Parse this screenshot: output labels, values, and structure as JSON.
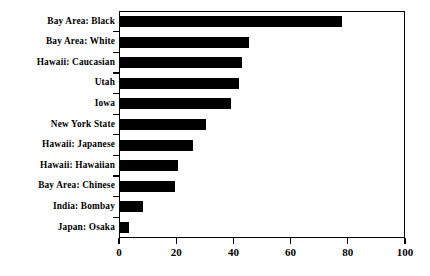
{
  "chart_data": {
    "type": "bar",
    "orientation": "horizontal",
    "title": "",
    "subtitle": "",
    "xlabel": "",
    "ylabel": "",
    "xlim": [
      0,
      100
    ],
    "xticks": [
      0,
      20,
      40,
      60,
      80,
      100
    ],
    "xtick_labels": [
      "0",
      "20",
      "40",
      "60",
      "80",
      "100"
    ],
    "grid": false,
    "legend": null,
    "bar_color": "#000000",
    "frame_color": "#000000",
    "background": "#ffffff",
    "categories": [
      "Bay Area: Black",
      "Bay Area: White",
      "Hawaii: Caucasian",
      "Utah",
      "Iowa",
      "New York State",
      "Hawaii: Japanese",
      "Hawaii: Hawaiian",
      "Bay Area: Chinese",
      "India: Bombay",
      "Japan: Osaka"
    ],
    "values": [
      78,
      45.5,
      43,
      42,
      39,
      30.5,
      26,
      20.5,
      19.5,
      8.5,
      3.5
    ]
  }
}
